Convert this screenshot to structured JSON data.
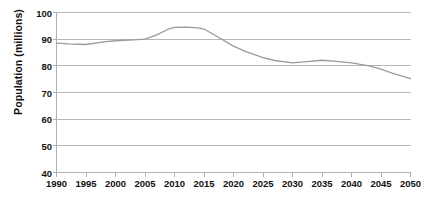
{
  "chart_data": {
    "type": "line",
    "title": "",
    "xlabel": "",
    "ylabel": "Population (millions)",
    "xlim": [
      1990,
      2050
    ],
    "ylim": [
      40,
      100
    ],
    "grid": true,
    "legend": false,
    "legend_position": "none",
    "line_color": "#9a9a9a",
    "axis_color": "#b0b0b0",
    "grid_color": "#b8b8b8",
    "xticks": [
      1990,
      1995,
      2000,
      2005,
      2010,
      2015,
      2020,
      2025,
      2030,
      2035,
      2040,
      2045,
      2050
    ],
    "xtick_labels": [
      "1990",
      "1995",
      "2000",
      "2005",
      "2010",
      "2015",
      "2020",
      "2025",
      "2030",
      "2035",
      "2040",
      "2045",
      "2050"
    ],
    "yticks": [
      40,
      50,
      60,
      70,
      80,
      90,
      100
    ],
    "ytick_labels": [
      "40",
      "50",
      "60",
      "70",
      "80",
      "90",
      "100"
    ],
    "series": [
      {
        "name": "Population",
        "x": [
          1990,
          1992,
          1995,
          1998,
          2000,
          2003,
          2005,
          2007,
          2009,
          2010,
          2012,
          2014,
          2015,
          2017,
          2020,
          2022,
          2025,
          2027,
          2030,
          2032,
          2035,
          2037,
          2040,
          2043,
          2045,
          2047,
          2050
        ],
        "values": [
          88.5,
          88.2,
          88.0,
          89.0,
          89.4,
          89.7,
          90.0,
          91.6,
          93.8,
          94.4,
          94.5,
          94.2,
          93.8,
          91.3,
          87.4,
          85.4,
          83.1,
          82.0,
          81.1,
          81.5,
          82.1,
          81.8,
          81.1,
          80.0,
          78.8,
          77.2,
          75.2
        ]
      }
    ]
  }
}
